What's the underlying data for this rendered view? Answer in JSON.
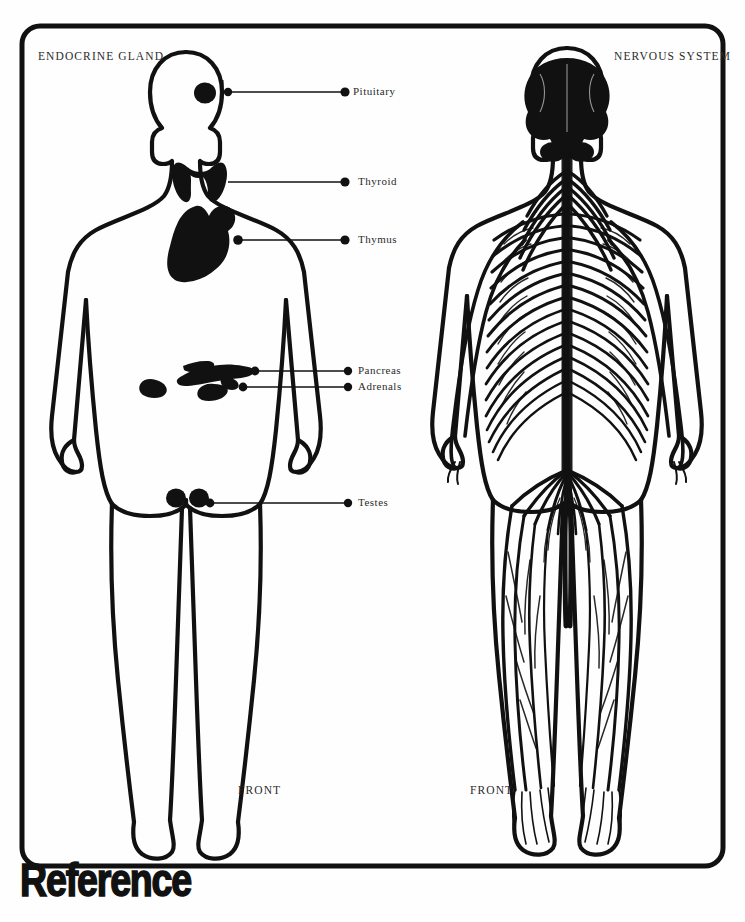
{
  "page": {
    "width": 745,
    "height": 922,
    "background_color": "#ffffff",
    "ink_color": "#111111",
    "text_color": "#2b2b2b",
    "frame": {
      "x": 22,
      "y": 26,
      "width": 701,
      "height": 840,
      "corner_radius": 18,
      "stroke_width": 5
    }
  },
  "wordmark": {
    "text": "Reference"
  },
  "panels": [
    {
      "id": "endocrine",
      "title": "ENDOCRINE GLAND",
      "title_pos": {
        "x": 38,
        "y": 56
      },
      "view_label": "FRONT",
      "view_label_pos": {
        "x": 238,
        "y": 790
      }
    },
    {
      "id": "nervous",
      "title": "NERVOUS SYSTEM",
      "title_pos": {
        "x": 614,
        "y": 56
      },
      "view_label": "FRONT",
      "view_label_pos": {
        "x": 470,
        "y": 790
      }
    }
  ],
  "organ_labels": [
    {
      "name": "Pituitary",
      "text_pos": {
        "x": 353,
        "y": 87
      },
      "dot": {
        "x": 345,
        "y": 92
      },
      "line": {
        "x1": 228,
        "y1": 92,
        "x2": 345,
        "y2": 92
      },
      "anchor": {
        "x": 228,
        "y": 92
      }
    },
    {
      "name": "Thyroid",
      "text_pos": {
        "x": 358,
        "y": 177
      },
      "dot": {
        "x": 345,
        "y": 182
      },
      "line": {
        "x1": 228,
        "y1": 182,
        "x2": 345,
        "y2": 182
      },
      "anchor": {
        "x": 228,
        "y": 182
      }
    },
    {
      "name": "Thymus",
      "text_pos": {
        "x": 358,
        "y": 234
      },
      "dot": {
        "x": 345,
        "y": 240
      },
      "line": {
        "x1": 238,
        "y1": 240,
        "x2": 345,
        "y2": 240
      },
      "anchor": {
        "x": 238,
        "y": 240
      }
    },
    {
      "name": "Pancreas",
      "text_pos": {
        "x": 358,
        "y": 366
      },
      "dot": {
        "x": 348,
        "y": 371
      },
      "line": {
        "x1": 255,
        "y1": 371,
        "x2": 348,
        "y2": 371
      },
      "anchor": {
        "x": 255,
        "y": 371
      }
    },
    {
      "name": "Adrenals",
      "text_pos": {
        "x": 358,
        "y": 382
      },
      "dot": {
        "x": 348,
        "y": 387
      },
      "line": {
        "x1": 243,
        "y1": 387,
        "x2": 348,
        "y2": 387
      },
      "anchor": {
        "x": 243,
        "y": 387
      }
    },
    {
      "name": "Testes",
      "text_pos": {
        "x": 358,
        "y": 498
      },
      "dot": {
        "x": 348,
        "y": 503
      },
      "line": {
        "x1": 210,
        "y1": 503,
        "x2": 348,
        "y2": 503
      },
      "anchor": {
        "x": 210,
        "y": 503
      }
    }
  ],
  "figures": {
    "endocrine": {
      "description": "front view human body outline with endocrine glands in solid black",
      "glands": [
        "pituitary",
        "thyroid",
        "thymus",
        "pancreas",
        "adrenals",
        "testes"
      ]
    },
    "nervous": {
      "description": "front view human body outline with brain, spinal cord and branching peripheral nerves in solid black",
      "parts": [
        "brain",
        "spinal-cord",
        "cervical-nerves",
        "intercostal-nerves",
        "lumbar-plexus",
        "sacral-plexus",
        "leg-nerves",
        "arm-nerves"
      ]
    }
  }
}
